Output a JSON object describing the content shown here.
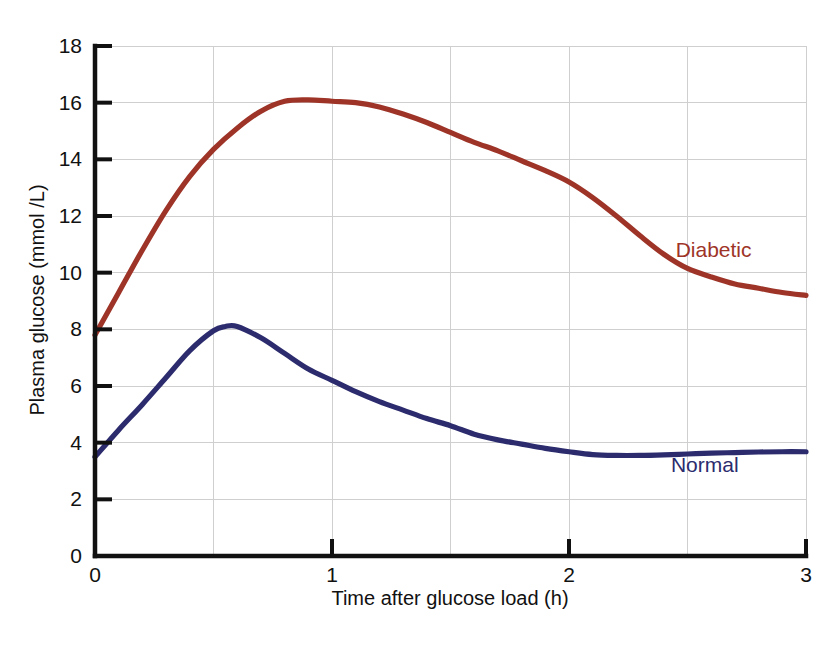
{
  "chart_data": {
    "type": "line",
    "title": "",
    "xlabel": "Time after glucose load (h)",
    "ylabel": "Plasma glucose (mmol /L)",
    "xlim": [
      0,
      3
    ],
    "ylim": [
      0,
      18
    ],
    "xticks": [
      "0",
      "1",
      "2",
      "3"
    ],
    "xtick_values": [
      0,
      1,
      2,
      3
    ],
    "yticks": [
      "0",
      "2",
      "4",
      "6",
      "8",
      "10",
      "12",
      "14",
      "16",
      "18"
    ],
    "ytick_values": [
      0,
      2,
      4,
      6,
      8,
      10,
      12,
      14,
      16,
      18
    ],
    "grid": true,
    "grid_x_step": 0.5,
    "grid_y_step": 2,
    "legend_position": "inline-right",
    "series": [
      {
        "name": "Diabetic",
        "color": "#9E3428",
        "label_color": "#9E3428",
        "label_x": 2.45,
        "label_y": 10.55,
        "x": [
          0.0,
          0.1,
          0.2,
          0.3,
          0.4,
          0.5,
          0.6,
          0.7,
          0.8,
          0.9,
          1.0,
          1.1,
          1.2,
          1.3,
          1.4,
          1.5,
          1.6,
          1.7,
          1.8,
          1.9,
          2.0,
          2.1,
          2.2,
          2.3,
          2.4,
          2.5,
          2.6,
          2.7,
          2.8,
          2.9,
          3.0
        ],
        "y": [
          7.8,
          9.3,
          10.8,
          12.2,
          13.4,
          14.35,
          15.1,
          15.7,
          16.05,
          16.1,
          16.05,
          16.0,
          15.85,
          15.6,
          15.3,
          14.95,
          14.6,
          14.3,
          13.95,
          13.6,
          13.2,
          12.65,
          12.0,
          11.3,
          10.65,
          10.15,
          9.85,
          9.6,
          9.45,
          9.3,
          9.2
        ]
      },
      {
        "name": "Normal",
        "color": "#2B2B6E",
        "label_color": "#2B2B6E",
        "label_x": 2.43,
        "label_y": 2.95,
        "x": [
          0.0,
          0.1,
          0.2,
          0.3,
          0.4,
          0.5,
          0.55,
          0.6,
          0.7,
          0.8,
          0.9,
          1.0,
          1.1,
          1.2,
          1.3,
          1.4,
          1.5,
          1.6,
          1.7,
          1.8,
          1.9,
          2.0,
          2.1,
          2.2,
          2.3,
          2.4,
          2.5,
          2.6,
          2.7,
          2.8,
          2.9,
          3.0
        ],
        "y": [
          3.5,
          4.45,
          5.35,
          6.3,
          7.25,
          7.95,
          8.1,
          8.1,
          7.7,
          7.15,
          6.6,
          6.2,
          5.8,
          5.45,
          5.15,
          4.85,
          4.6,
          4.3,
          4.1,
          3.95,
          3.8,
          3.68,
          3.58,
          3.55,
          3.55,
          3.57,
          3.6,
          3.63,
          3.65,
          3.67,
          3.68,
          3.68
        ]
      }
    ],
    "annotations": [
      {
        "text": "Diabetic",
        "color": "#9E3428"
      },
      {
        "text": "Normal",
        "color": "#2B2B6E"
      }
    ]
  }
}
